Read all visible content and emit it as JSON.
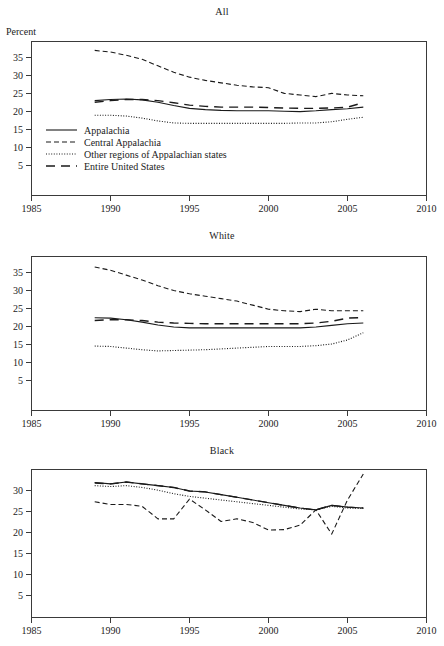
{
  "figure": {
    "y_axis_unit": "Percent",
    "panels": [
      "All",
      "White",
      "Black"
    ]
  },
  "legend": {
    "items": [
      {
        "label": "Appalachia",
        "style": "solid"
      },
      {
        "label": "Central Appalachia",
        "style": "dashed"
      },
      {
        "label": "Other regions of Appalachian states",
        "style": "dotted"
      },
      {
        "label": "Entire United States",
        "style": "longdash"
      }
    ]
  },
  "axes": {
    "x_ticks": [
      "1985",
      "1990",
      "1995",
      "2000",
      "2005",
      "2010"
    ],
    "y_ticks_all": [
      "35",
      "30",
      "25",
      "20",
      "15",
      "10",
      "5"
    ],
    "y_ticks_white": [
      "35",
      "30",
      "25",
      "20",
      "15",
      "10",
      "5"
    ],
    "y_ticks_black": [
      "30",
      "25",
      "20",
      "15",
      "10",
      "5"
    ]
  },
  "chart_data": {
    "type": "line",
    "title": "",
    "xlabel": "",
    "ylabel": "Percent",
    "xlim": [
      1985,
      2010
    ],
    "grid": false,
    "legend_position": "inside-lower-left (panel 1)",
    "panels": [
      {
        "name": "All",
        "title": "All",
        "ylim": [
          0,
          38
        ],
        "yticks": [
          5,
          10,
          15,
          20,
          25,
          30,
          35
        ],
        "x": [
          1989,
          1990,
          1991,
          1992,
          1993,
          1994,
          1995,
          1996,
          1997,
          1998,
          1999,
          2000,
          2001,
          2002,
          2003,
          2004,
          2005,
          2006
        ],
        "series": [
          {
            "name": "Appalachia",
            "style": "solid",
            "values": [
              23.4,
              23.7,
              23.8,
              23.6,
              23.0,
              22.2,
              21.5,
              21.2,
              21.0,
              20.9,
              20.9,
              20.9,
              20.8,
              20.7,
              20.9,
              21.2,
              21.4,
              21.8
            ]
          },
          {
            "name": "Central Appalachia",
            "style": "dashed",
            "values": [
              35.8,
              35.4,
              34.6,
              33.6,
              32.0,
              30.4,
              29.2,
              28.4,
              27.8,
              27.2,
              26.8,
              26.6,
              25.2,
              24.8,
              24.4,
              25.2,
              24.8,
              24.6
            ]
          },
          {
            "name": "Other regions of Appalachian states",
            "style": "dotted",
            "values": [
              19.8,
              19.8,
              19.6,
              19.1,
              18.4,
              17.9,
              17.8,
              17.8,
              17.8,
              17.8,
              17.8,
              17.8,
              17.8,
              17.9,
              17.9,
              18.2,
              18.8,
              19.3
            ]
          },
          {
            "name": "Entire United States",
            "style": "longdash",
            "values": [
              23.0,
              23.4,
              23.7,
              23.7,
              23.4,
              22.9,
              22.3,
              22.0,
              21.8,
              21.8,
              21.8,
              21.7,
              21.6,
              21.5,
              21.5,
              21.6,
              21.8,
              22.9
            ]
          }
        ]
      },
      {
        "name": "White",
        "title": "White",
        "ylim": [
          0,
          38
        ],
        "yticks": [
          5,
          10,
          15,
          20,
          25,
          30,
          35
        ],
        "x": [
          1989,
          1990,
          1991,
          1992,
          1993,
          1994,
          1995,
          1996,
          1997,
          1998,
          1999,
          2000,
          2001,
          2002,
          2003,
          2004,
          2005,
          2006
        ],
        "series": [
          {
            "name": "Appalachia",
            "style": "solid",
            "values": [
              22.9,
              22.8,
              22.4,
              21.8,
              21.1,
              20.6,
              20.4,
              20.4,
              20.4,
              20.4,
              20.4,
              20.4,
              20.4,
              20.4,
              20.6,
              21.0,
              21.4,
              21.6
            ]
          },
          {
            "name": "Central Appalachia",
            "style": "dashed",
            "values": [
              35.4,
              34.6,
              33.4,
              32.2,
              30.8,
              29.6,
              28.8,
              28.2,
              27.6,
              27.0,
              26.0,
              25.0,
              24.6,
              24.4,
              25.0,
              24.6,
              24.6,
              24.6
            ]
          },
          {
            "name": "Other regions of Appalachian states",
            "style": "dotted",
            "values": [
              15.9,
              15.8,
              15.4,
              15.0,
              14.7,
              14.8,
              14.9,
              15.0,
              15.2,
              15.4,
              15.6,
              15.8,
              15.8,
              15.8,
              16.0,
              16.4,
              17.4,
              19.2
            ]
          },
          {
            "name": "Entire United States",
            "style": "longdash",
            "values": [
              22.2,
              22.4,
              22.4,
              22.2,
              21.8,
              21.6,
              21.5,
              21.4,
              21.4,
              21.4,
              21.4,
              21.4,
              21.4,
              21.4,
              21.6,
              22.0,
              22.8,
              22.9
            ]
          }
        ]
      },
      {
        "name": "Black",
        "title": "Black",
        "ylim": [
          0,
          33
        ],
        "yticks": [
          5,
          10,
          15,
          20,
          25,
          30
        ],
        "x": [
          1989,
          1990,
          1991,
          1992,
          1993,
          1994,
          1995,
          1996,
          1997,
          1998,
          1999,
          2000,
          2001,
          2002,
          2003,
          2004,
          2005,
          2006
        ],
        "series": [
          {
            "name": "Appalachia",
            "style": "solid",
            "values": [
              30.1,
              29.8,
              30.2,
              29.8,
              29.4,
              29.0,
              28.2,
              28.0,
              27.4,
              26.8,
              26.2,
              25.6,
              25.0,
              24.4,
              24.0,
              25.0,
              24.6,
              24.4
            ]
          },
          {
            "name": "Central Appalachia",
            "style": "dashed",
            "values": [
              25.8,
              25.2,
              25.2,
              24.8,
              22.0,
              22.0,
              26.4,
              24.0,
              21.4,
              22.0,
              21.2,
              19.5,
              19.6,
              20.6,
              24.0,
              18.6,
              26.2,
              32.0
            ]
          },
          {
            "name": "Other regions of Appalachian states",
            "style": "dotted",
            "values": [
              29.4,
              29.2,
              29.4,
              29.0,
              28.4,
              27.6,
              27.0,
              26.6,
              26.2,
              25.8,
              25.4,
              25.0,
              24.6,
              24.2,
              24.0,
              24.8,
              24.4,
              24.3
            ]
          },
          {
            "name": "Entire United States",
            "style": "longdash",
            "values": [
              30.0,
              29.8,
              30.2,
              29.8,
              29.4,
              29.0,
              28.2,
              28.0,
              27.4,
              26.8,
              26.2,
              25.6,
              25.0,
              24.4,
              24.0,
              25.0,
              24.6,
              24.4
            ]
          }
        ]
      }
    ]
  }
}
